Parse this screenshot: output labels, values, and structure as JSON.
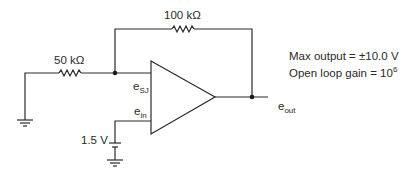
{
  "diagram": {
    "type": "op-amp circuit",
    "components": {
      "feedback_resistor": {
        "label": "100 kΩ"
      },
      "input_resistor": {
        "label": "50 kΩ"
      },
      "battery": {
        "label": "1.5 V"
      }
    },
    "nodes": {
      "summing_junction": {
        "label": "e",
        "subscript": "SJ"
      },
      "noninverting_input": {
        "label": "e",
        "subscript": "in"
      },
      "output": {
        "label": "e",
        "subscript": "out"
      }
    },
    "specs": {
      "max_output": "Max output = ±10.0 V",
      "open_loop_gain_prefix": "Open loop gain = 10",
      "open_loop_gain_exponent": "6"
    },
    "colors": {
      "line": "#2a2a2a",
      "background": "#ffffff"
    }
  }
}
